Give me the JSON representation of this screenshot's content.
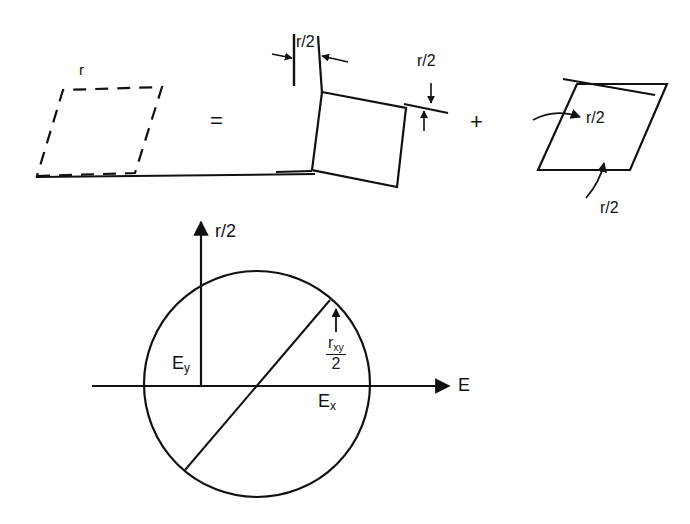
{
  "figure": {
    "background_color": "#ffffff",
    "ink_color": "#111111",
    "equation": {
      "equals_symbol": "=",
      "plus_symbol": "+"
    },
    "top_row": {
      "left_shape": {
        "name": "dashed-parallelogram",
        "label": "r",
        "style": "dashed"
      },
      "middle_shape": {
        "name": "rotated-square",
        "style": "solid",
        "label_left": "r/2",
        "label_right": "r/2"
      },
      "right_shape": {
        "name": "sheared-parallelogram",
        "style": "solid",
        "label_inner": "r/2",
        "label_bottom": "r/2"
      }
    },
    "mohr_circle": {
      "vertical_axis_label": "r/2",
      "horizontal_axis_label": "E",
      "point_left_label": "E",
      "point_left_sub": "y",
      "point_right_label": "E",
      "point_right_sub": "x",
      "radius_label_numerator": "r",
      "radius_label_numerator_sub": "xy",
      "radius_label_denominator": "2"
    }
  }
}
